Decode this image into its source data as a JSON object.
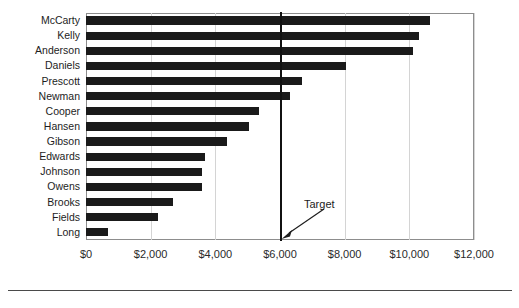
{
  "chart_data": {
    "type": "bar",
    "orientation": "horizontal",
    "title": "",
    "xlabel": "",
    "ylabel": "",
    "xlim": [
      0,
      12000
    ],
    "xticks": [
      "$0",
      "$2,000",
      "$4,000",
      "$6,000",
      "$8,000",
      "$10,000",
      "$12,000"
    ],
    "xtick_values": [
      0,
      2000,
      4000,
      6000,
      8000,
      10000,
      12000
    ],
    "grid": true,
    "legend": "none",
    "categories": [
      "McCarty",
      "Kelly",
      "Anderson",
      "Daniels",
      "Prescott",
      "Newman",
      "Cooper",
      "Hansen",
      "Gibson",
      "Edwards",
      "Johnson",
      "Owens",
      "Brooks",
      "Fields",
      "Long"
    ],
    "values": [
      10650,
      10300,
      10100,
      8050,
      6680,
      6300,
      5350,
      5050,
      4350,
      3670,
      3580,
      3580,
      2680,
      2220,
      680
    ],
    "bar_color": "#1a1a1a",
    "annotations": [
      {
        "label": "Target",
        "value": 6000,
        "type": "vertical-line-with-arrow"
      }
    ]
  },
  "annotation": {
    "target_label": "Target"
  }
}
